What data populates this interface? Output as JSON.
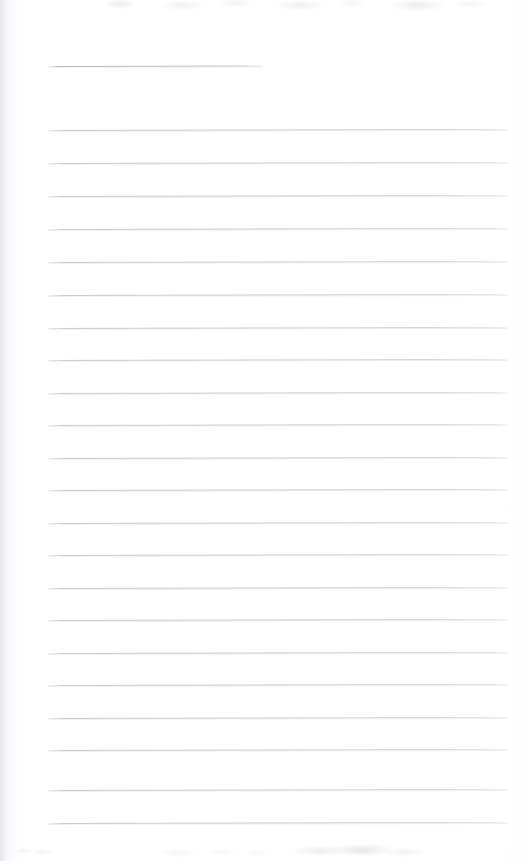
{
  "document": {
    "kind": "blank-ruled-page",
    "title": "",
    "body_text": "",
    "page_width": 527,
    "page_height": 861,
    "background_color": "#fefeff",
    "rule_color": "#c9c9ce",
    "title_rule_color": "#b7b7c0"
  },
  "rules": {
    "title_rule": {
      "name": "title-rule",
      "x": 48,
      "y": 66,
      "width": 215,
      "tilt_deg": -0.12,
      "value": ""
    },
    "body_rule_left": 48,
    "body_rule_right": 508,
    "body_rule_width": 460,
    "body_rule_spacing": 32.6,
    "body_rule_count": 21,
    "body_rules": [
      {
        "index": 1,
        "y": 130,
        "value": ""
      },
      {
        "index": 2,
        "y": 163,
        "value": ""
      },
      {
        "index": 3,
        "y": 196,
        "value": ""
      },
      {
        "index": 4,
        "y": 229,
        "value": ""
      },
      {
        "index": 5,
        "y": 262,
        "value": ""
      },
      {
        "index": 6,
        "y": 295,
        "value": ""
      },
      {
        "index": 7,
        "y": 328,
        "value": ""
      },
      {
        "index": 8,
        "y": 360,
        "value": ""
      },
      {
        "index": 9,
        "y": 393,
        "value": ""
      },
      {
        "index": 10,
        "y": 425,
        "value": ""
      },
      {
        "index": 11,
        "y": 458,
        "value": ""
      },
      {
        "index": 12,
        "y": 490,
        "value": ""
      },
      {
        "index": 13,
        "y": 523,
        "value": ""
      },
      {
        "index": 14,
        "y": 555,
        "value": ""
      },
      {
        "index": 15,
        "y": 588,
        "value": ""
      },
      {
        "index": 16,
        "y": 620,
        "value": ""
      },
      {
        "index": 17,
        "y": 653,
        "value": ""
      },
      {
        "index": 18,
        "y": 685,
        "value": ""
      },
      {
        "index": 19,
        "y": 718,
        "value": ""
      },
      {
        "index": 20,
        "y": 750,
        "value": ""
      },
      {
        "index": 21,
        "y": 790,
        "value": ""
      },
      {
        "index": 22,
        "y": 823,
        "value": ""
      }
    ]
  },
  "artifacts": {
    "left_edge_shadow": true,
    "top_edge_noise": true,
    "bottom_edge_noise": true
  }
}
